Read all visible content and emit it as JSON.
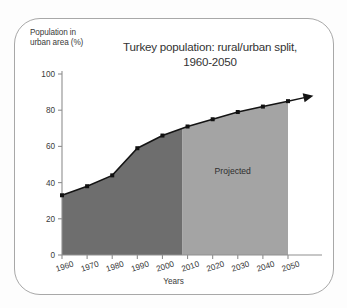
{
  "figure": {
    "frame_border_color": "#a8a8a8",
    "background": "#ffffff"
  },
  "chart_data": {
    "type": "area",
    "title": "Turkey population: rural/urban split, 1960-2050",
    "title_line1": "Turkey population: rural/urban split,",
    "title_line2": "1960-2050",
    "xlabel": "Years",
    "ylabel": "Population in urban area (%)",
    "ylabel_line1": "Population in",
    "ylabel_line2": "urban area (%)",
    "x": [
      1960,
      1970,
      1980,
      1990,
      2000,
      2010,
      2020,
      2030,
      2040,
      2050
    ],
    "values": [
      33,
      38,
      44,
      59,
      66,
      71,
      75,
      79,
      82,
      85
    ],
    "categories": [
      "1960",
      "1970",
      "1980",
      "1990",
      "2000",
      "2010",
      "2020",
      "2030",
      "2040",
      "2050"
    ],
    "xlim": [
      1960,
      2050
    ],
    "ylim": [
      0,
      100
    ],
    "ytick_labels": [
      "0",
      "20",
      "40",
      "60",
      "80",
      "100"
    ],
    "yticks": [
      0,
      20,
      40,
      60,
      80,
      100
    ],
    "xtick_labels": [
      "1960",
      "1970",
      "1980",
      "1990",
      "2000",
      "2010",
      "2020",
      "2030",
      "2040",
      "2050"
    ],
    "grid": false,
    "legend_position": "none",
    "annotations": [
      {
        "text": "Projected",
        "x": 2028,
        "y": 45
      }
    ],
    "regions": [
      {
        "name": "observed",
        "x_start": 1960,
        "x_end": 2008,
        "color": "#6e6e6e"
      },
      {
        "name": "projected",
        "x_start": 2008,
        "x_end": 2050,
        "color": "#a4a4a4"
      }
    ],
    "line_color": "#141414",
    "marker_color": "#111111",
    "marker": "square",
    "arrow_end": true
  }
}
